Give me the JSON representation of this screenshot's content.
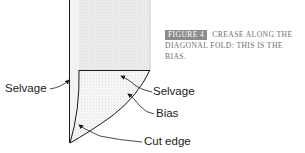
{
  "figure": {
    "tag": "FIGURE 4",
    "caption": "CREASE ALONG THE DIAGONAL FOLD: THIS IS THE BIAS.",
    "tag_color": "#8c8c8c",
    "caption_color": "#6e6e6e"
  },
  "labels": {
    "selvage_left": "Selvage",
    "selvage_right": "Selvage",
    "bias": "Bias",
    "cut_edge": "Cut edge"
  },
  "colors": {
    "fabric_fill": "#ececec",
    "fold_fill": "#f4f4f4",
    "outline": "#1a1a1a"
  }
}
